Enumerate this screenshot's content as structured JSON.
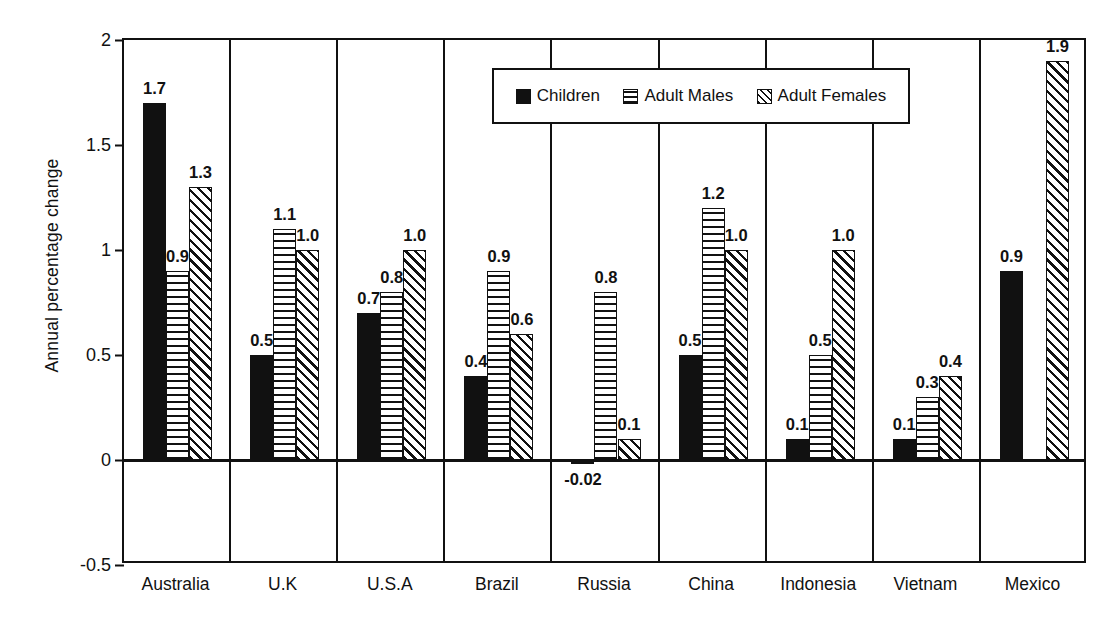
{
  "chart_data": {
    "type": "bar",
    "title": "",
    "xlabel": "",
    "ylabel": "Annual percentage change",
    "ylim": [
      -0.5,
      2
    ],
    "yticks": [
      "2",
      "1.5",
      "1",
      "0.5",
      "0",
      "-0.5"
    ],
    "ytick_values": [
      2,
      1.5,
      1,
      0.5,
      0,
      -0.5
    ],
    "grid": false,
    "legend_position": "top-center",
    "categories": [
      "Australia",
      "U.K",
      "U.S.A",
      "Brazil",
      "Russia",
      "China",
      "Indonesia",
      "Vietnam",
      "Mexico"
    ],
    "series": [
      {
        "name": "Children",
        "pattern": "solid-black",
        "values": [
          1.7,
          0.5,
          0.7,
          0.4,
          -0.02,
          0.5,
          0.1,
          0.1,
          0.9
        ],
        "labels": [
          "1.7",
          "0.5",
          "0.7",
          "0.4",
          "-0.02",
          "0.5",
          "0.1",
          "0.1",
          "0.9"
        ]
      },
      {
        "name": "Adult Males",
        "pattern": "horizontal-lines",
        "values": [
          0.9,
          1.1,
          0.8,
          0.9,
          0.8,
          1.2,
          0.5,
          0.3,
          null
        ],
        "labels": [
          "0.9",
          "1.1",
          "0.8",
          "0.9",
          "0.8",
          "1.2",
          "0.5",
          "0.3",
          ""
        ]
      },
      {
        "name": "Adult Females",
        "pattern": "diagonal-hatch",
        "values": [
          1.3,
          1.0,
          1.0,
          0.6,
          0.1,
          1.0,
          1.0,
          0.4,
          1.9
        ],
        "labels": [
          "1.3",
          "1.0",
          "1.0",
          "0.6",
          "0.1",
          "1.0",
          "1.0",
          "0.4",
          "1.9"
        ]
      }
    ]
  },
  "colors": {
    "ink": "#111111",
    "background": "#ffffff"
  }
}
